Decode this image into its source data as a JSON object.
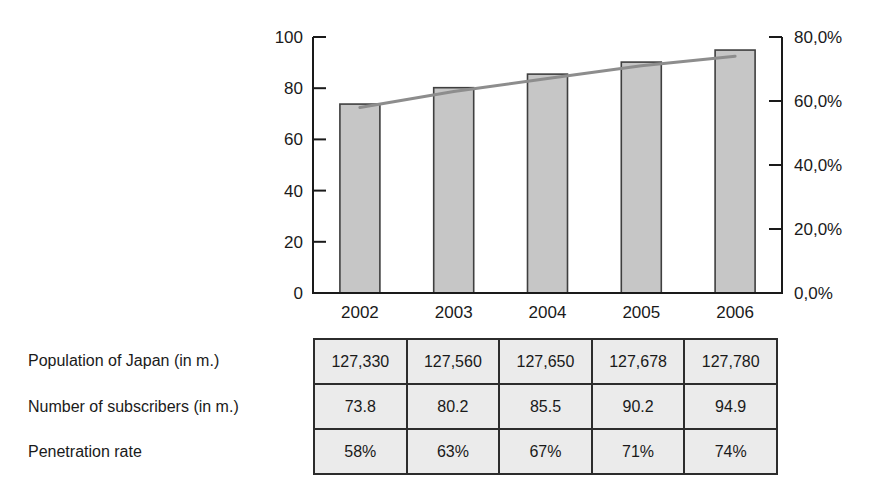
{
  "chart_data": {
    "type": "bar",
    "categories": [
      "2002",
      "2003",
      "2004",
      "2005",
      "2006"
    ],
    "series": [
      {
        "name": "Number of subscribers (in m.)",
        "render": "bar",
        "axis": "left",
        "values": [
          73.8,
          80.2,
          85.5,
          90.2,
          94.9
        ]
      },
      {
        "name": "Penetration rate",
        "render": "line",
        "axis": "right",
        "values": [
          58,
          63,
          67,
          71,
          74
        ]
      }
    ],
    "title": "",
    "xlabel": "",
    "ylabel": "",
    "left_axis": {
      "min": 0,
      "max": 100,
      "ticks": [
        0,
        20,
        40,
        60,
        80,
        100
      ],
      "tick_labels": [
        "0",
        "20",
        "40",
        "60",
        "80",
        "100"
      ]
    },
    "right_axis": {
      "min": 0,
      "max": 80,
      "ticks": [
        0,
        20,
        40,
        60,
        80
      ],
      "tick_labels": [
        "0,0%",
        "20,0%",
        "40,0%",
        "60,0%",
        "80,0%"
      ]
    },
    "grid": false,
    "legend": "none",
    "colors": {
      "bar_fill": "#c6c6c6",
      "bar_border": "#3f3f3f",
      "line": "#8d8d8d",
      "axis": "#1a1a1a",
      "text": "#1a1a1a",
      "cell_bg": "#ebebeb",
      "table_border": "#2c2c2c"
    }
  },
  "table": {
    "rows": [
      {
        "label": "Population of Japan (in m.)",
        "values": [
          "127,330",
          "127,560",
          "127,650",
          "127,678",
          "127,780"
        ]
      },
      {
        "label": "Number of subscribers (in m.)",
        "values": [
          "73.8",
          "80.2",
          "85.5",
          "90.2",
          "94.9"
        ]
      },
      {
        "label": "Penetration rate",
        "values": [
          "58%",
          "63%",
          "67%",
          "71%",
          "74%"
        ]
      }
    ]
  }
}
